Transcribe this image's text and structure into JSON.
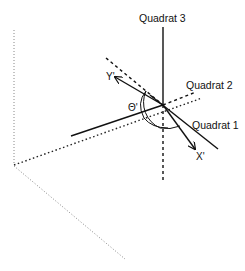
{
  "diagram": {
    "labels": {
      "quadrat3": "Quadrat 3",
      "quadrat2": "Quadrat 2",
      "quadrat1": "Quadrat 1",
      "y_axis": "Y'",
      "x_axis": "X'",
      "theta": "Θ'"
    },
    "colors": {
      "line": "#111111",
      "dotted_faint": "#888888",
      "background": "#ffffff"
    },
    "center": [
      163,
      105
    ]
  }
}
